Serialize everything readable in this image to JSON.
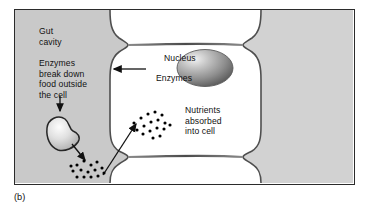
{
  "figure": {
    "caption": "(b)",
    "frame": {
      "border_color": "#2b2b2b",
      "background": "#ffffff"
    },
    "regions": {
      "gut_cavity": {
        "name": "Gut cavity",
        "fill": "#c9c9c9",
        "position": "left"
      },
      "body_tissue": {
        "name": "Body tissue side",
        "fill": "#d2d2d2",
        "position": "right"
      },
      "cells": {
        "name": "Epithelial cells",
        "fill": "#ffffff",
        "membrane_color": "#5a5a5a",
        "count": 3
      }
    },
    "labels": {
      "gut_cavity": "Gut\ncavity",
      "enzymes_break_down": "Enzymes\nbreak down\nfood outside\nthe cell",
      "nucleus": "Nucleus",
      "enzymes": "Enzymes",
      "nutrients_absorbed": "Nutrients\nabsorbed\ninto cell",
      "nutrients": "Nutrients"
    },
    "structures": {
      "nucleus": {
        "name": "Nucleus",
        "shape": "ellipse",
        "fill_light": "#e8e8e8",
        "fill_dark": "#6f6f6f",
        "cx": 203,
        "cy": 58,
        "rx": 27,
        "ry": 18
      },
      "food_particle": {
        "name": "Food particle",
        "shape": "irregular-blob",
        "fill_light": "#f2f2f2",
        "fill_dark": "#9a9a9a",
        "outline": "#2b2b2b",
        "cx": 45,
        "cy": 126
      }
    },
    "particles": {
      "nutrients_in_gut": {
        "name": "Nutrient molecules in gut cavity",
        "color": "#000000",
        "count": 15,
        "dots": [
          [
            75,
            161
          ],
          [
            82,
            158
          ],
          [
            88,
            162
          ],
          [
            94,
            159
          ],
          [
            70,
            167
          ],
          [
            78,
            166
          ],
          [
            85,
            168
          ],
          [
            92,
            166
          ],
          [
            99,
            164
          ],
          [
            74,
            173
          ],
          [
            81,
            173
          ],
          [
            88,
            173
          ],
          [
            95,
            172
          ],
          [
            101,
            169
          ],
          [
            68,
            162
          ]
        ]
      },
      "nutrients_in_cell": {
        "name": "Nutrient molecules absorbed into cell",
        "color": "#000000",
        "count": 17,
        "dots": [
          [
            127,
            121
          ],
          [
            134,
            116
          ],
          [
            141,
            112
          ],
          [
            148,
            110
          ],
          [
            155,
            113
          ],
          [
            130,
            128
          ],
          [
            137,
            124
          ],
          [
            144,
            120
          ],
          [
            151,
            118
          ],
          [
            158,
            121
          ],
          [
            136,
            132
          ],
          [
            143,
            129
          ],
          [
            150,
            126
          ],
          [
            157,
            127
          ],
          [
            163,
            123
          ],
          [
            146,
            136
          ],
          [
            153,
            134
          ]
        ]
      }
    },
    "arrows": {
      "enzymes_to_gut": {
        "name": "Enzymes arrow pointing into gut cavity",
        "direction": "left",
        "from": [
          138,
          67
        ],
        "to": [
          98,
          67
        ]
      },
      "enzymes_break_down_to_food": {
        "name": "Arrow from enzyme text down to food particle",
        "direction": "down",
        "from": [
          46,
          95
        ],
        "to": [
          46,
          110
        ]
      },
      "food_to_nutrients": {
        "name": "Arrow from food particle to nutrients",
        "direction": "down-right",
        "from": [
          58,
          140
        ],
        "to": [
          72,
          157
        ]
      },
      "nutrients_into_cell": {
        "name": "Arrow from gut nutrients into cell",
        "direction": "up-right",
        "from": [
          96,
          173
        ],
        "to": [
          129,
          121
        ]
      }
    }
  }
}
